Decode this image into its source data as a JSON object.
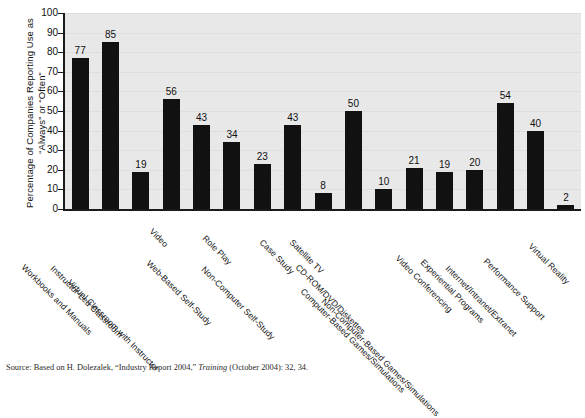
{
  "chart_data": {
    "type": "bar",
    "title": "",
    "xlabel": "",
    "ylabel": "Percentage of Companies Reporting Use as\n“Always” or “Often”",
    "ylim": [
      0,
      100
    ],
    "yticks": [
      0,
      10,
      20,
      30,
      40,
      50,
      60,
      70,
      80,
      90,
      100
    ],
    "grid": true,
    "legend": "none",
    "bar_color": "#111111",
    "plot_background": "#e8e8e8",
    "categories": [
      "Workbooks and Manuals",
      "Instructor-Led Classroom",
      "Virtual Classroom with Instructor",
      "Video",
      "Web-Based Self-Study",
      "Role Play",
      "Non-Computer Self-Study",
      "Case Study",
      "Satellite TV",
      "CD-ROM/DVD/Diskettes",
      "Computer-Based Games/Simulations",
      "Non-Computer-Based Games/Simulations",
      "Video Conferencing",
      "Experiential Programs",
      "Internet/Intranet/Extranet",
      "Performance Support",
      "Virtual Reality"
    ],
    "values": [
      77,
      85,
      19,
      56,
      43,
      34,
      23,
      43,
      8,
      50,
      10,
      21,
      19,
      20,
      54,
      40,
      2
    ]
  },
  "source": {
    "prefix": "Source: Based on H. Dolezalek, “Industry Report 2004,” ",
    "italic": "Training",
    "suffix": " (October 2004): 32, 34."
  }
}
